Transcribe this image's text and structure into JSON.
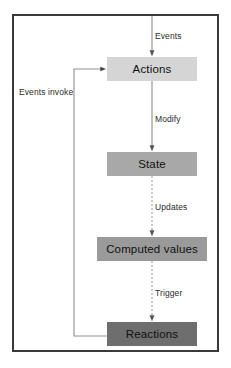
{
  "diagram": {
    "type": "flowchart",
    "orientation": "vertical-with-feedback-loop",
    "frame": {
      "border_color": "#3a3a3a",
      "background": "#ffffff"
    },
    "nodes": [
      {
        "id": "actions",
        "label": "Actions",
        "fill": "#d5d5d5"
      },
      {
        "id": "state",
        "label": "State",
        "fill": "#a8a8a8"
      },
      {
        "id": "computed",
        "label": "Computed values",
        "fill": "#9a9a9a"
      },
      {
        "id": "reactions",
        "label": "Reactions",
        "fill": "#6e6e6e"
      }
    ],
    "edges": [
      {
        "id": "events",
        "label": "Events",
        "from": "top-border",
        "to": "actions",
        "style": "solid",
        "direction": "down"
      },
      {
        "id": "modify",
        "label": "Modify",
        "from": "actions",
        "to": "state",
        "style": "solid",
        "direction": "down"
      },
      {
        "id": "updates",
        "label": "Updates",
        "from": "state",
        "to": "computed",
        "style": "dashed",
        "direction": "down"
      },
      {
        "id": "trigger",
        "label": "Trigger",
        "from": "computed",
        "to": "reactions",
        "style": "dashed",
        "direction": "down"
      },
      {
        "id": "invoke",
        "label": "Events invoke",
        "from": "reactions",
        "to": "actions",
        "style": "solid",
        "direction": "feedback-left"
      }
    ]
  }
}
